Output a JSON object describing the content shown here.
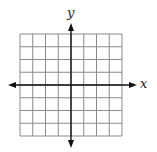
{
  "diagram": {
    "type": "coordinate-plane",
    "grid": {
      "columns": 8,
      "rows": 8,
      "left": 20,
      "top": 34,
      "cell_size": 12.75,
      "line_color": "#8a8a8a"
    },
    "axes": {
      "color": "#111111",
      "x_axis": {
        "y": 85,
        "from": 8,
        "to": 137,
        "arrows": "both",
        "label": "x"
      },
      "y_axis": {
        "x": 71,
        "from": 23,
        "to": 148,
        "arrows": "both",
        "label": "y"
      }
    }
  }
}
